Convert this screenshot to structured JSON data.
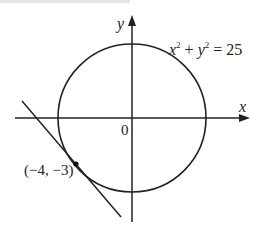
{
  "diagram": {
    "equation": {
      "x_var": "x",
      "x_exp": "2",
      "plus": " + ",
      "y_var": "y",
      "y_exp": "2",
      "rhs": " = 25",
      "full": "x² + y² = 25"
    },
    "axes": {
      "x_label": "x",
      "y_label": "y",
      "origin_label": "0"
    },
    "point": {
      "label": "(−4, −3)",
      "x": -4,
      "y": -3
    },
    "circle": {
      "center": [
        0,
        0
      ],
      "radius": 5
    },
    "tangent_line": {
      "through": [
        -4,
        -3
      ],
      "slope": -1.3333,
      "equation": "4x + 3y + 25 = 0"
    },
    "colors": {
      "stroke": "#222222",
      "background": "#ffffff",
      "top_strip": "#e6e6e6"
    }
  }
}
